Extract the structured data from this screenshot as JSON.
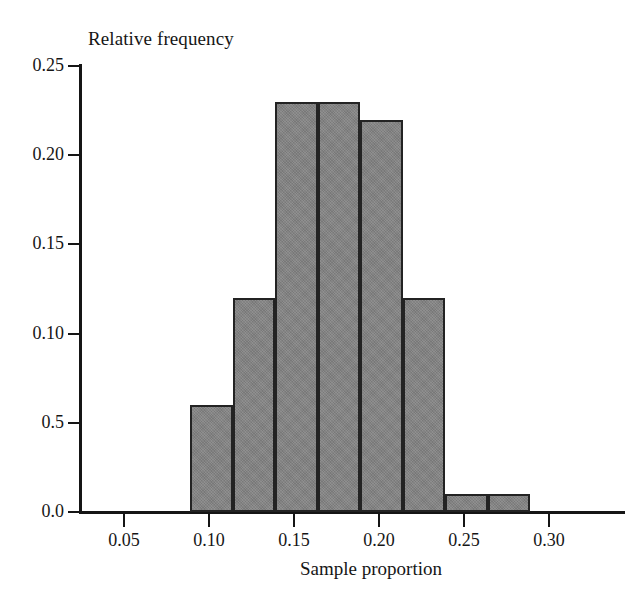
{
  "chart_data": {
    "type": "bar",
    "title": "",
    "xlabel": "Sample proportion",
    "ylabel": "Relative frequency",
    "orientation": "vertical",
    "grid": false,
    "legend": null,
    "xlim": [
      0.025,
      0.335
    ],
    "ylim": [
      0.0,
      0.25
    ],
    "bin_width": 0.025,
    "bin_edges": [
      0.089,
      0.114,
      0.139,
      0.164,
      0.189,
      0.214,
      0.239,
      0.264,
      0.289
    ],
    "categories": [
      "0.089-0.114",
      "0.114-0.139",
      "0.139-0.164",
      "0.164-0.189",
      "0.189-0.214",
      "0.214-0.239",
      "0.239-0.264",
      "0.264-0.289"
    ],
    "values": [
      0.06,
      0.12,
      0.23,
      0.23,
      0.22,
      0.12,
      0.01,
      0.01
    ],
    "x_ticks": [
      0.05,
      0.1,
      0.15,
      0.2,
      0.25,
      0.3
    ],
    "x_tick_labels": [
      "0.05",
      "0.10",
      "0.15",
      "0.20",
      "0.25",
      "0.30"
    ],
    "y_ticks": [
      0.0,
      0.05,
      0.1,
      0.15,
      0.2,
      0.25
    ],
    "y_tick_labels": [
      "0.0",
      "0.5",
      "0.10",
      "0.15",
      "0.20",
      "0.25"
    ],
    "bar_color": "#848484",
    "bar_edge_color": "#232323",
    "axis_color": "#151515",
    "background_color": "#ffffff"
  },
  "labels": {
    "y_axis_title": "Relative frequency",
    "x_axis_title": "Sample proportion"
  }
}
